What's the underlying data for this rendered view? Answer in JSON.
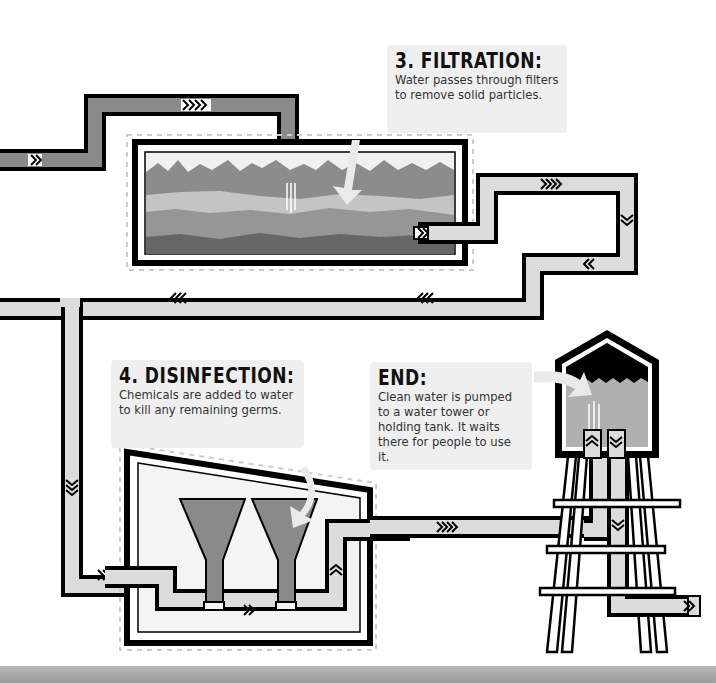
{
  "diagram": {
    "colors": {
      "pipe_dark": "#8a8a8a",
      "pipe_light": "#dcdcdc",
      "outline": "#000000",
      "callout_bg": "#efefef",
      "tank_water": "#b0b0b0",
      "layer_top": "#f0f0f0",
      "layer_1": "#8c8c8c",
      "layer_2": "#c4c4c4",
      "layer_3": "#969696",
      "layer_4": "#666666",
      "funnel": "#8a8a8a",
      "bottom_band": "#a8a8a8"
    }
  },
  "callouts": {
    "filtration": {
      "title": "3. FILTRATION:",
      "body": "Water passes through filters to remove solid particles."
    },
    "disinfection": {
      "title": "4. DISINFECTION:",
      "body": "Chemicals are added to water to kill any remaining germs."
    },
    "end": {
      "title": "END:",
      "body": "Clean water is pumped to a water tower or holding tank. It waits there for people to use it."
    }
  },
  "stages": [
    {
      "name": "filtration-tank",
      "label": "Filtration tank"
    },
    {
      "name": "disinfection-tank",
      "label": "Disinfection tank"
    },
    {
      "name": "water-tower",
      "label": "Water tower"
    }
  ]
}
